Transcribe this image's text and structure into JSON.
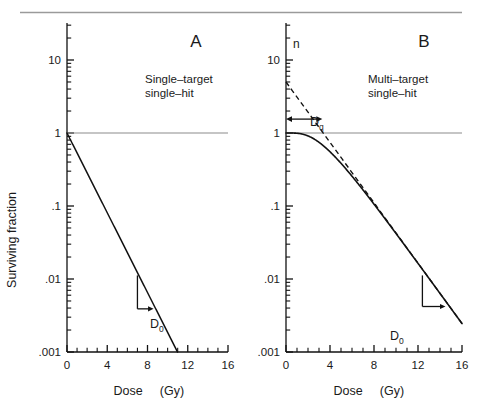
{
  "figure": {
    "top_rule_color": "#9a9a9a",
    "curve_color": "#111111",
    "axis_color": "#111111",
    "reference_line_color": "#8c8c8c",
    "background": "#ffffff"
  },
  "axes": {
    "ylabel": "Surviving  fraction",
    "xlabel_main": "Dose",
    "xlabel_unit": "(Gy)",
    "y_tick_labels": [
      "10",
      "1",
      ".1",
      ".01",
      ".001"
    ],
    "y_tick_values": [
      10,
      1,
      0.1,
      0.01,
      0.001
    ],
    "x_tick_labels": [
      "0",
      "4",
      "8",
      "12",
      "16"
    ],
    "x_tick_values": [
      0,
      4,
      8,
      12,
      16
    ],
    "xlim": [
      0,
      16
    ],
    "ylim": [
      0.001,
      30
    ],
    "y_scale": "log",
    "x_minor_step": 1,
    "grid": "none",
    "reference_line_y": 1
  },
  "panels": [
    {
      "letter": "A",
      "caption_line1": "Single–target",
      "caption_line2": "single–hit",
      "annotation": "D",
      "annotation_sub": "0",
      "d0_gy": 1.59
    },
    {
      "letter": "B",
      "caption_line1": "Multi–target",
      "caption_line2": "single–hit",
      "annotation": "D",
      "annotation_sub": "0",
      "shoulder_label": "D",
      "shoulder_sub": "q",
      "extrapolation_label": "n",
      "d0_gy": 2.1,
      "dq_gy": 3.3,
      "n_value": 5.0
    }
  ],
  "chart_data": [
    {
      "type": "line",
      "title": "A",
      "subtitle": "Single-target single-hit",
      "xlabel": "Dose  (Gy)",
      "ylabel": "Surviving  fraction",
      "xlim": [
        0,
        16
      ],
      "ylim": [
        0.001,
        30
      ],
      "yscale": "log",
      "xticks": [
        0,
        4,
        8,
        12,
        16
      ],
      "yticks": [
        10,
        1,
        0.1,
        0.01,
        0.001
      ],
      "grid": false,
      "legend": "none",
      "series": [
        {
          "name": "single-target single-hit survival",
          "style": "solid",
          "model": "S = exp(-D/D0), D0 = 1.59 Gy",
          "x": [
            0,
            1,
            2,
            3,
            4,
            5,
            6,
            7,
            8,
            9,
            10,
            11
          ],
          "y": [
            1.0,
            0.533,
            0.285,
            0.152,
            0.0811,
            0.0433,
            0.0231,
            0.0123,
            0.00657,
            0.00351,
            0.00187,
            0.001
          ]
        },
        {
          "name": "surviving-fraction = 1 reference line",
          "style": "solid-gray",
          "x": [
            0,
            16
          ],
          "y": [
            1,
            1
          ]
        }
      ],
      "annotations": [
        {
          "text": "D0",
          "type": "slope-triangle",
          "x_start": 7.0,
          "x_end": 8.6,
          "y_top": 0.0112,
          "y_bottom": 0.0039,
          "note": "one D0 of dose reduces survival by factor e"
        }
      ]
    },
    {
      "type": "line",
      "title": "B",
      "subtitle": "Multi-target single-hit",
      "xlabel": "Dose  (Gy)",
      "ylabel": "Surviving  fraction",
      "xlim": [
        0,
        16
      ],
      "ylim": [
        0.001,
        30
      ],
      "yscale": "log",
      "xticks": [
        0,
        4,
        8,
        12,
        16
      ],
      "yticks": [
        10,
        1,
        0.1,
        0.01,
        0.001
      ],
      "grid": false,
      "legend": "none",
      "series": [
        {
          "name": "multi-target single-hit survival",
          "style": "solid",
          "model": "S = 1 - (1 - exp(-D/D0))^n, D0 = 2.1 Gy, n = 5",
          "x": [
            0,
            1,
            2,
            3,
            4,
            5,
            6,
            7,
            8,
            9,
            10,
            11,
            12,
            13,
            14,
            15,
            16
          ],
          "y": [
            1.0,
            0.9999,
            0.9985,
            0.9885,
            0.9555,
            0.8833,
            0.7669,
            0.6195,
            0.4662,
            0.3302,
            0.2232,
            0.1459,
            0.0933,
            0.0587,
            0.0365,
            0.0226,
            0.0139
          ]
        },
        {
          "name": "extrapolated terminal slope",
          "style": "dashed",
          "model": "S = n * exp(-D/D0), n = 5, D0 = 2.1 Gy",
          "x": [
            0,
            2,
            4,
            6,
            8,
            10,
            12,
            14,
            16
          ],
          "y": [
            5.0,
            1.93,
            0.745,
            0.288,
            0.111,
            0.043,
            0.0166,
            0.0064,
            0.00248
          ]
        },
        {
          "name": "surviving-fraction = 1 reference line",
          "style": "solid-gray",
          "x": [
            0,
            16
          ],
          "y": [
            1,
            1
          ]
        }
      ],
      "annotations": [
        {
          "text": "n",
          "type": "axis-intercept-label",
          "x": 0,
          "y": 5.0,
          "note": "extrapolation number, intercept of dashed line"
        },
        {
          "text": "Dq",
          "type": "double-arrow",
          "x_start": 0,
          "x_end": 3.3,
          "y": 1.55,
          "note": "quasi-threshold dose, where extrapolated line crosses SF = 1"
        },
        {
          "text": "D0",
          "type": "slope-triangle",
          "x_start": 12.4,
          "x_end": 14.5,
          "y_top": 0.0112,
          "y_bottom": 0.0042,
          "note": "final slope of the multi-target curve"
        }
      ]
    }
  ]
}
